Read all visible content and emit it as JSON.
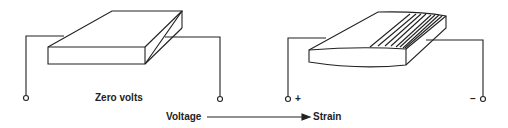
{
  "diagram": {
    "left": {
      "label": "Zero volts",
      "state": "unstrained"
    },
    "right": {
      "positive_terminal": "+",
      "negative_terminal": "–",
      "state": "strained"
    },
    "flow": {
      "from": "Voltage",
      "to": "Strain"
    },
    "colors": {
      "line": "#222222",
      "background": "#ffffff"
    }
  }
}
